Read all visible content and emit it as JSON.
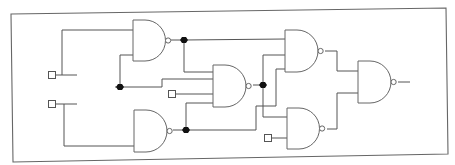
{
  "diagram": {
    "colors": {
      "wire": "#555555",
      "gate_outline": "#666666",
      "junction": "#111111",
      "background": "#ffffff"
    },
    "gate_type": "NAND",
    "gates": [
      {
        "id": "g1",
        "type": "NAND",
        "inputs": 2
      },
      {
        "id": "g2",
        "type": "NAND",
        "inputs": 1
      },
      {
        "id": "g3",
        "type": "NAND",
        "inputs": 4
      },
      {
        "id": "g4",
        "type": "NAND",
        "inputs": 3
      },
      {
        "id": "g5",
        "type": "NAND",
        "inputs": 2
      },
      {
        "id": "g6",
        "type": "NAND",
        "inputs": 2
      }
    ],
    "input_terminals": [
      {
        "id": "in1",
        "feeds": "g1"
      },
      {
        "id": "in2",
        "feeds": "g2"
      },
      {
        "id": "in3",
        "feeds": "g3"
      },
      {
        "id": "in4",
        "feeds": "g5"
      }
    ],
    "junctions": [
      {
        "id": "j1",
        "net": "g1.out"
      },
      {
        "id": "j2",
        "net": "g1.in2"
      },
      {
        "id": "j3",
        "net": "g3.out"
      },
      {
        "id": "j4",
        "net": "g2.out"
      }
    ],
    "connections": [
      {
        "from": "in1",
        "to": "g1.in1"
      },
      {
        "from": "in2",
        "to": "g2.in1"
      },
      {
        "from": "j2",
        "to": "g1.in2"
      },
      {
        "from": "j2",
        "to": "g3.in2"
      },
      {
        "from": "g1.out",
        "to": "g4.in1"
      },
      {
        "from": "g1.out",
        "to": "g3.in1"
      },
      {
        "from": "in3",
        "to": "g3.in3"
      },
      {
        "from": "g2.out",
        "to": "g3.in4"
      },
      {
        "from": "g2.out",
        "to": "g4.in3"
      },
      {
        "from": "g3.out",
        "to": "g4.in2"
      },
      {
        "from": "g3.out",
        "to": "g5.in1"
      },
      {
        "from": "in4",
        "to": "g5.in2"
      },
      {
        "from": "g4.out",
        "to": "g6.in1"
      },
      {
        "from": "g5.out",
        "to": "g6.in2"
      },
      {
        "from": "g6.out",
        "to": "output"
      }
    ]
  }
}
